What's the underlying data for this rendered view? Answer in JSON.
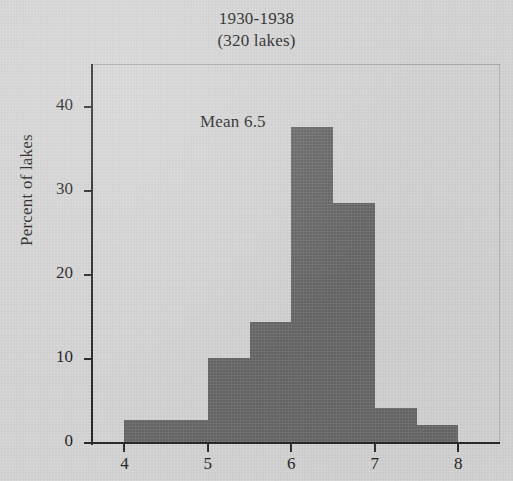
{
  "title": {
    "main": "1930-1938",
    "sub": "(320 lakes)"
  },
  "annotation": {
    "mean_label": "Mean 6.5"
  },
  "axes": {
    "ylabel": "Percent of lakes",
    "xlabel": "",
    "yticks": [
      0,
      10,
      20,
      30,
      40
    ],
    "ytick_labels": [
      "0",
      "10",
      "20",
      "30",
      "40"
    ],
    "xticks": [
      4,
      5,
      6,
      7,
      8
    ],
    "xtick_labels": [
      "4",
      "5",
      "6",
      "7",
      "8"
    ]
  },
  "colors": {
    "background": "#d4d4d4",
    "bar_fill": "#676767",
    "axis": "#262626",
    "text": "#1a1a1a"
  },
  "chart_data": {
    "type": "bar",
    "title": "1930-1938 (320 lakes)",
    "xlabel": "",
    "ylabel": "Percent of lakes",
    "xlim": [
      3.6,
      8.5
    ],
    "ylim": [
      0,
      45
    ],
    "grid": false,
    "legend": null,
    "annotations": [
      {
        "text": "Mean 6.5",
        "x": 5.9,
        "y": 40
      }
    ],
    "bin_edges": [
      4,
      5,
      5.5,
      6,
      6.5,
      7,
      7.5,
      8
    ],
    "bins": [
      {
        "from": 4,
        "to": 5,
        "value": 2.6
      },
      {
        "from": 5,
        "to": 5.5,
        "value": 10.0
      },
      {
        "from": 5.5,
        "to": 6,
        "value": 14.3
      },
      {
        "from": 6,
        "to": 6.5,
        "value": 37.5
      },
      {
        "from": 6.5,
        "to": 7,
        "value": 28.5
      },
      {
        "from": 7,
        "to": 7.5,
        "value": 4.0
      },
      {
        "from": 7.5,
        "to": 8,
        "value": 2.0
      }
    ],
    "categories": [
      "4-5",
      "5-5.5",
      "5.5-6",
      "6-6.5",
      "6.5-7",
      "7-7.5",
      "7.5-8"
    ],
    "values": [
      2.6,
      10.0,
      14.3,
      37.5,
      28.5,
      4.0,
      2.0
    ]
  }
}
